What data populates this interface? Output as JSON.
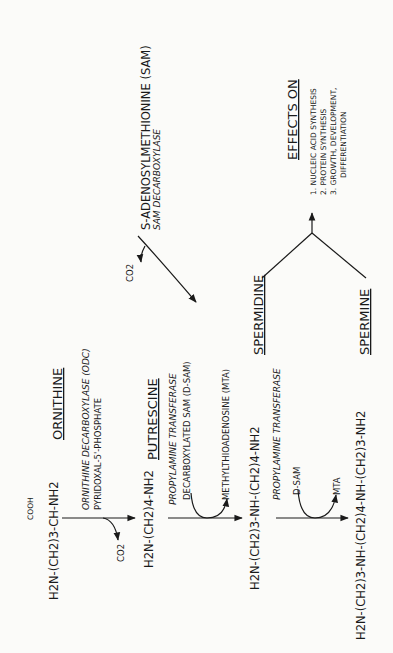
{
  "diagram": {
    "orientation": "rotated 90 degrees counter-clockwise",
    "nodes": {
      "ornithine": {
        "formula_top": "COOH",
        "formula_bond": "|",
        "formula": "H2N-(CH2)3-CH-NH2",
        "name": "ORNITHINE"
      },
      "putrescine": {
        "formula": "H2N-(CH2)4-NH2",
        "name": "PUTRESCINE"
      },
      "spermidine": {
        "formula": "H2N-(CH2)3-NH-(CH2)4-NH2",
        "name": "SPERMIDINE"
      },
      "spermine": {
        "formula": "H2N-(CH2)3-NH-(CH2)4-NH-(CH2)3-NH2",
        "name": "SPERMINE"
      },
      "sam": {
        "name": "S-ADENOSYLMETHIONINE  (SAM)",
        "enzyme": "SAM DECARBOXYLASE",
        "byproduct": "CO2"
      }
    },
    "steps": [
      {
        "enzyme": "ORNITHINE DECARBOXYLASE (ODC)",
        "cofactor": "PYRIDOXAL-5'-PHOSPHATE",
        "byproduct": "CO2"
      },
      {
        "enzyme": "PROPYLAMINE TRANSFERASE",
        "input": "DECARBOXYLATED SAM  (D-SAM)",
        "output": "METHYLTHIOADENOSINE  (MTA)"
      },
      {
        "enzyme": "PROPYLAMINE TRANSFERASE",
        "input": "D-SAM",
        "output": "MTA"
      }
    ],
    "effects": {
      "title": "EFFECTS ON",
      "items": [
        "1. NUCLEIC  ACID SYNTHESIS",
        "2. PROTEIN  SYNTHESIS",
        "3. GROWTH, DEVELOPMENT,",
        "DIFFERENTIATION"
      ]
    }
  }
}
